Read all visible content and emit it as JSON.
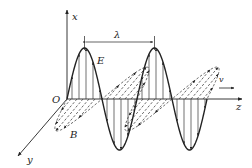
{
  "diagram": {
    "labels": {
      "x_axis": "x",
      "y_axis": "y",
      "z_axis": "z",
      "origin": "O",
      "electric_field": "E",
      "magnetic_field": "B",
      "wavelength": "λ",
      "velocity": "v"
    },
    "colors": {
      "line": "#222222",
      "dashed": "#444444",
      "background": "#ffffff"
    },
    "geometry": {
      "origin": [
        67,
        99
      ],
      "wavelength_px": 70,
      "e_amplitude_px": 51,
      "b_amplitude_px": 42,
      "periods": 2
    }
  }
}
